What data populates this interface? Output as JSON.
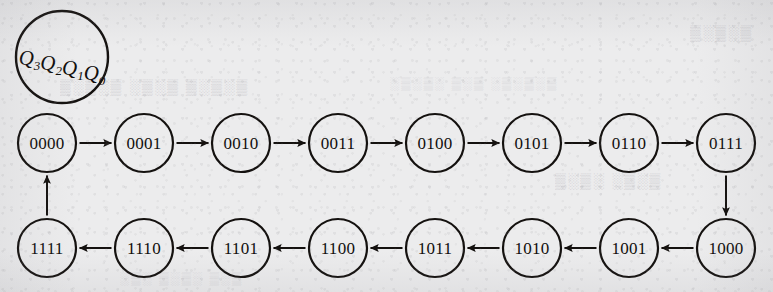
{
  "figure": {
    "kind": "state-transition-diagram",
    "width": 773,
    "height": 292,
    "background_color": "#ececed",
    "ink_color": "#14110f"
  },
  "legend": {
    "name": "state-variable-legend",
    "base_symbol": "Q",
    "bits": [
      {
        "symbol": "Q",
        "subscript": "3"
      },
      {
        "symbol": "Q",
        "subscript": "2"
      },
      {
        "symbol": "Q",
        "subscript": "1"
      },
      {
        "symbol": "Q",
        "subscript": "0"
      }
    ],
    "text": "Q3Q2Q1Q0",
    "cx": 62,
    "cy": 57,
    "r": 46
  },
  "geometry": {
    "node_radius": 29,
    "row_top_y": 143,
    "row_bottom_y": 248,
    "column_spacing": 94,
    "first_column_x": 47
  },
  "states": [
    {
      "id": "s0",
      "label": "0000",
      "row": "top",
      "col": 0,
      "cx": 47,
      "cy": 143
    },
    {
      "id": "s1",
      "label": "0001",
      "row": "top",
      "col": 1,
      "cx": 144,
      "cy": 143
    },
    {
      "id": "s2",
      "label": "0010",
      "row": "top",
      "col": 2,
      "cx": 241,
      "cy": 143
    },
    {
      "id": "s3",
      "label": "0011",
      "row": "top",
      "col": 3,
      "cx": 338,
      "cy": 143
    },
    {
      "id": "s4",
      "label": "0100",
      "row": "top",
      "col": 4,
      "cx": 435,
      "cy": 143
    },
    {
      "id": "s5",
      "label": "0101",
      "row": "top",
      "col": 5,
      "cx": 532,
      "cy": 143
    },
    {
      "id": "s6",
      "label": "0110",
      "row": "top",
      "col": 6,
      "cx": 629,
      "cy": 143
    },
    {
      "id": "s7",
      "label": "0111",
      "row": "top",
      "col": 7,
      "cx": 726,
      "cy": 143
    },
    {
      "id": "s8",
      "label": "1000",
      "row": "bottom",
      "col": 7,
      "cx": 726,
      "cy": 248
    },
    {
      "id": "s9",
      "label": "1001",
      "row": "bottom",
      "col": 6,
      "cx": 629,
      "cy": 248
    },
    {
      "id": "s10",
      "label": "1010",
      "row": "bottom",
      "col": 5,
      "cx": 532,
      "cy": 248
    },
    {
      "id": "s11",
      "label": "1011",
      "row": "bottom",
      "col": 4,
      "cx": 435,
      "cy": 248
    },
    {
      "id": "s12",
      "label": "1100",
      "row": "bottom",
      "col": 3,
      "cx": 338,
      "cy": 248
    },
    {
      "id": "s13",
      "label": "1101",
      "row": "bottom",
      "col": 2,
      "cx": 241,
      "cy": 248
    },
    {
      "id": "s14",
      "label": "1110",
      "row": "bottom",
      "col": 1,
      "cx": 144,
      "cy": 248
    },
    {
      "id": "s15",
      "label": "1111",
      "row": "bottom",
      "col": 0,
      "cx": 47,
      "cy": 248
    }
  ],
  "transitions": [
    {
      "from": "0000",
      "to": "0001",
      "direction": "right"
    },
    {
      "from": "0001",
      "to": "0010",
      "direction": "right"
    },
    {
      "from": "0010",
      "to": "0011",
      "direction": "right"
    },
    {
      "from": "0011",
      "to": "0100",
      "direction": "right"
    },
    {
      "from": "0100",
      "to": "0101",
      "direction": "right"
    },
    {
      "from": "0101",
      "to": "0110",
      "direction": "right"
    },
    {
      "from": "0110",
      "to": "0111",
      "direction": "right"
    },
    {
      "from": "0111",
      "to": "1000",
      "direction": "down"
    },
    {
      "from": "1000",
      "to": "1001",
      "direction": "left"
    },
    {
      "from": "1001",
      "to": "1010",
      "direction": "left"
    },
    {
      "from": "1010",
      "to": "1011",
      "direction": "left"
    },
    {
      "from": "1011",
      "to": "1100",
      "direction": "left"
    },
    {
      "from": "1100",
      "to": "1101",
      "direction": "left"
    },
    {
      "from": "1101",
      "to": "1110",
      "direction": "left"
    },
    {
      "from": "1110",
      "to": "1111",
      "direction": "left"
    },
    {
      "from": "1111",
      "to": "0000",
      "direction": "up"
    }
  ],
  "bleed_through": {
    "note": "faint reverse-side print showing through the scanned page",
    "marks": [
      {
        "text": "▒░▒░▒ ░▒░▒ ▒░▒░▒",
        "x": 60,
        "y": 92
      },
      {
        "text": "░▒░▒░ ▒░▒ ░▒░▒░▒",
        "x": 390,
        "y": 88
      },
      {
        "text": "▒░▒░ ░▒░▒",
        "x": 555,
        "y": 186
      },
      {
        "text": "░▒░ ▒░▒░ ▒░▒",
        "x": 120,
        "y": 283
      },
      {
        "text": "▒░▒░▒",
        "x": 690,
        "y": 38
      }
    ]
  }
}
